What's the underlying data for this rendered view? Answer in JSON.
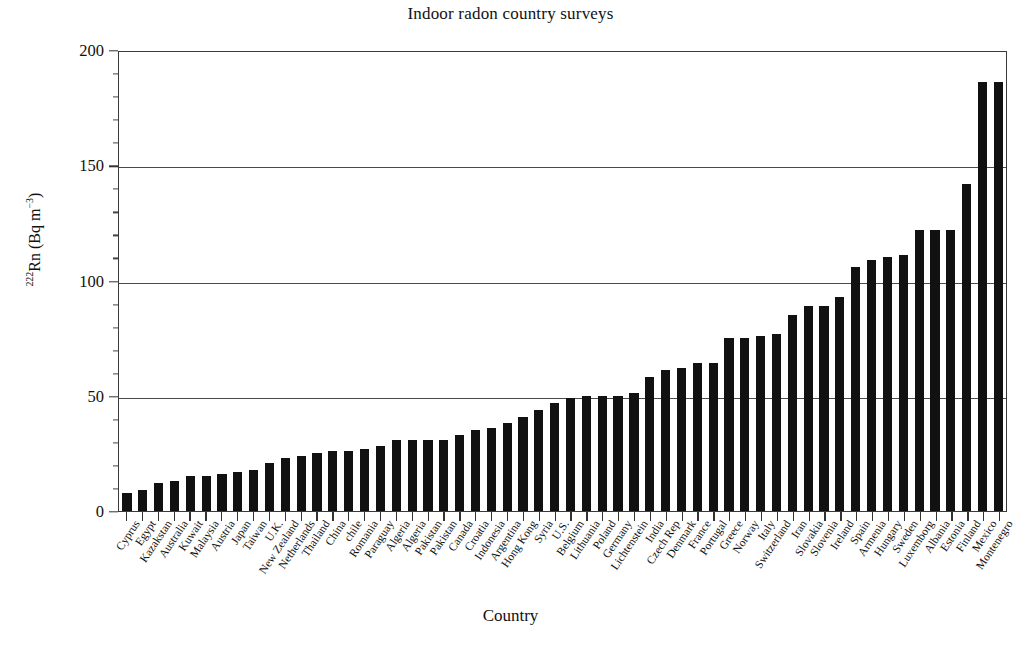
{
  "chart_data": {
    "type": "bar",
    "title": "Indoor radon country surveys",
    "xlabel": "Country",
    "ylabel_html": "<sup>222</sup>Rn (Bq m<sup>−3</sup>)",
    "ylabel": "222Rn (Bq m-3)",
    "ylim": [
      0,
      200
    ],
    "yticks": [
      0,
      50,
      100,
      150,
      200
    ],
    "ytick_labels": [
      "0",
      "50",
      "100",
      "150",
      "200"
    ],
    "y_minor_step": 10,
    "grid": "horizontal gridlines at 50, 100, 150",
    "legend": "none",
    "bar_color": "#111111",
    "categories": [
      "Cyprus",
      "Egypt",
      "Kazakstan",
      "Australia",
      "Kuwait",
      "Malaysia",
      "Austria",
      "Japan",
      "Taiwan",
      "U.K.",
      "New Zealand",
      "Netherlands",
      "Thailand",
      "China",
      "chile",
      "Romania",
      "Paraguay",
      "Algeria",
      "Algeria",
      "Pakistan",
      "Pakistan",
      "Canada",
      "Croatia",
      "Indonesia",
      "Argentina",
      "Hong Kong",
      "Syria",
      "U.S.",
      "Belgium",
      "Lithuania",
      "Poland",
      "Germany",
      "Lichtenstein",
      "India",
      "Czech Rep",
      "Denmark",
      "France",
      "Portugal",
      "Greece",
      "Norway",
      "Italy",
      "Switzerland",
      "Iran",
      "Slovakia",
      "Slovenia",
      "Ireland",
      "Spain",
      "Armenia",
      "Hungary",
      "Sweden",
      "Luxemborg",
      "Albania",
      "Estonia",
      "Finland",
      "Mexico",
      "Montenegro"
    ],
    "values": [
      8,
      9,
      12,
      13,
      15,
      15,
      16,
      17,
      18,
      21,
      23,
      24,
      25,
      26,
      26,
      27,
      28,
      31,
      31,
      31,
      31,
      33,
      35,
      36,
      38,
      41,
      44,
      47,
      49,
      50,
      50,
      50,
      51,
      58,
      61,
      62,
      64,
      64,
      75,
      75,
      76,
      77,
      85,
      89,
      89,
      93,
      106,
      109,
      110,
      111,
      122,
      122,
      122,
      142,
      186,
      186
    ]
  }
}
